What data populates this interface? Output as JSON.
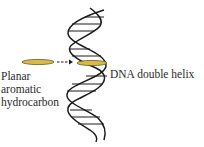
{
  "diagram": {
    "labels": {
      "left_line1": "Planar",
      "left_line2": "aromatic",
      "left_line3": "hydrocarbon",
      "right": "DNA double helix"
    },
    "colors": {
      "disc_fill": "#d8b94a",
      "disc_stroke": "#6b5a1c",
      "ink": "#1a1a1a"
    },
    "elements": [
      {
        "id": "planar-aromatic-hydrocarbon",
        "shape": "flat-ellipse-disc"
      },
      {
        "id": "intercalation-arrow",
        "shape": "dashed-arrow",
        "direction": "right"
      },
      {
        "id": "dna-double-helix",
        "shape": "double-helix-with-base-pair-rungs"
      },
      {
        "id": "intercalated-molecule",
        "shape": "flat-disc-between-base-pairs"
      }
    ]
  }
}
